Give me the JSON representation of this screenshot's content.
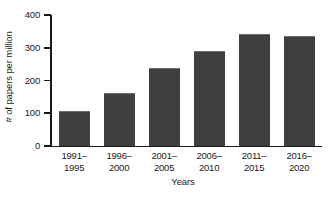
{
  "chart_data": {
    "type": "bar",
    "title": "",
    "xlabel": "Years",
    "ylabel": "# of papers per million",
    "categories": [
      "1991–1995",
      "1996–2000",
      "2001–2005",
      "2006–2010",
      "2011–2015",
      "2016–2020"
    ],
    "category_lines": [
      [
        "1991–",
        "1995"
      ],
      [
        "1996–",
        "2000"
      ],
      [
        "2001–",
        "2005"
      ],
      [
        "2006–",
        "2010"
      ],
      [
        "2011–",
        "2015"
      ],
      [
        "2016–",
        "2020"
      ]
    ],
    "values": [
      108,
      161,
      238,
      291,
      341,
      336
    ],
    "ylim": [
      0,
      400
    ],
    "ytick_values": [
      0,
      100,
      200,
      300,
      400
    ],
    "ytick_labels": [
      "0",
      "100",
      "200",
      "300",
      "400"
    ],
    "grid": false,
    "legend": "none",
    "bar_color": "#3f3f3f",
    "bar_edge_color": "#6d6d6d",
    "axis_color": "#1a1a1a",
    "background_color": "#ffffff"
  }
}
